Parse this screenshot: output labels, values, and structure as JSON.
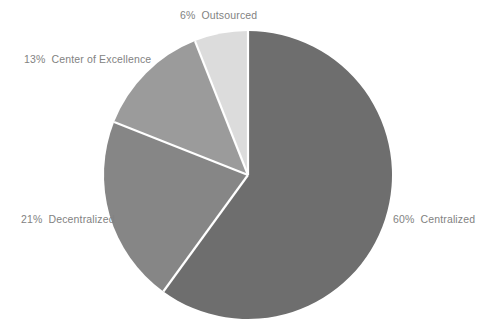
{
  "chart_data": {
    "type": "pie",
    "title": "",
    "labels": [
      "Centralized",
      "Decentralized",
      "Center of Excellence",
      "Outsourced"
    ],
    "values": [
      60,
      21,
      13,
      6
    ],
    "value_suffix": "%",
    "legend": "none",
    "start_angle_deg": 0,
    "direction": "clockwise",
    "background": "#ffffff",
    "slices": [
      {
        "name": "Centralized",
        "value": 60,
        "percent_label": "60%",
        "label_text": "Centralized",
        "color": "#6e6e6e",
        "label_position": "right"
      },
      {
        "name": "Decentralized",
        "value": 21,
        "percent_label": "21%",
        "label_text": "Decentralized",
        "color": "#868686",
        "label_position": "left"
      },
      {
        "name": "Center of Excellence",
        "value": 13,
        "percent_label": "13%",
        "label_text": "Center of Excellence",
        "color": "#9b9b9b",
        "label_position": "upper-left"
      },
      {
        "name": "Outsourced",
        "value": 6,
        "percent_label": "6%",
        "label_text": "Outsourced",
        "color": "#dcdcdc",
        "label_position": "top"
      }
    ],
    "geometry": {
      "center_x": 248,
      "center_y": 175,
      "radius": 144,
      "separator_color": "#ffffff",
      "separator_width": 2.2
    },
    "label_color": "#828282"
  }
}
